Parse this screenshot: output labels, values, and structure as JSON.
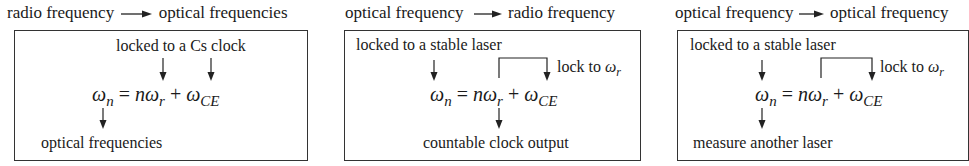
{
  "panels": [
    {
      "title_from": "radio frequency",
      "title_to": "optical frequencies",
      "top_label": "locked to a Cs clock",
      "equation": {
        "lhs": "ω",
        "lhs_sub": "n",
        "eq": "=",
        "n": "n",
        "rep": "ω",
        "rep_sub": "r",
        "plus": "+",
        "ce": "ω",
        "ce_sub": "CE"
      },
      "bottom_label": "optical frequencies"
    },
    {
      "title_from": "optical frequency",
      "title_to": "radio frequency",
      "top_label": "locked to a stable laser",
      "side_label": "lock to ",
      "side_symbol": "ω",
      "side_sub": "r",
      "equation": {
        "lhs": "ω",
        "lhs_sub": "n",
        "eq": "=",
        "n": "n",
        "rep": "ω",
        "rep_sub": "r",
        "plus": "+",
        "ce": "ω",
        "ce_sub": "CE"
      },
      "bottom_label": "countable clock output"
    },
    {
      "title_from": "optical frequency",
      "title_to": "optical frequency",
      "top_label": "locked to a stable laser",
      "side_label": "lock to ",
      "side_symbol": "ω",
      "side_sub": "r",
      "equation": {
        "lhs": "ω",
        "lhs_sub": "n",
        "eq": "=",
        "n": "n",
        "rep": "ω",
        "rep_sub": "r",
        "plus": "+",
        "ce": "ω",
        "ce_sub": "CE"
      },
      "bottom_label": "measure another laser"
    }
  ]
}
